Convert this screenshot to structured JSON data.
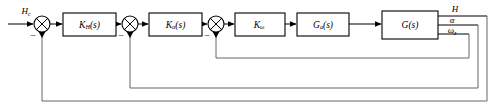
{
  "diagram": {
    "type": "control-system-block-diagram",
    "colors": {
      "line": "#000000",
      "feedback_line": "#555555",
      "background": "#ffffff",
      "block_fill": "#ffffff"
    },
    "input": {
      "label": "H",
      "subscript": "c",
      "name": "commanded-altitude-input"
    },
    "blocks": [
      {
        "id": "k-h",
        "label": "K",
        "subscript": "H",
        "suffix": "(s)",
        "x": 63,
        "y": 13,
        "w": 53,
        "h": 23
      },
      {
        "id": "k-alpha",
        "label": "K",
        "subscript": "α",
        "suffix": "(s)",
        "x": 149,
        "y": 13,
        "w": 53,
        "h": 23
      },
      {
        "id": "k-omega",
        "label": "K",
        "subscript": "ω",
        "suffix": "",
        "x": 235,
        "y": 13,
        "w": 50,
        "h": 23
      },
      {
        "id": "g-a",
        "label": "G",
        "subscript": "a",
        "suffix": "(s)",
        "x": 297,
        "y": 13,
        "w": 52,
        "h": 23
      },
      {
        "id": "g-plant",
        "label": "G",
        "subscript": "",
        "suffix": "(s)",
        "x": 382,
        "y": 11,
        "w": 56,
        "h": 28
      }
    ],
    "summing_junctions": [
      {
        "id": "sum-1",
        "cx": 42,
        "cy": 24,
        "r": 8,
        "sign": "−"
      },
      {
        "id": "sum-2",
        "cx": 130,
        "cy": 24,
        "r": 8,
        "sign": "−"
      },
      {
        "id": "sum-3",
        "cx": 216,
        "cy": 24,
        "r": 8,
        "sign": "−"
      }
    ],
    "outputs": [
      {
        "id": "out-h",
        "label": "H",
        "subscript": "",
        "x": 455,
        "y": 11
      },
      {
        "id": "out-alpha",
        "label": "α",
        "subscript": "",
        "x": 455,
        "y": 24
      },
      {
        "id": "out-omega",
        "label": "ω",
        "subscript": "z",
        "x": 455,
        "y": 37
      }
    ],
    "feedback_paths": [
      {
        "id": "fb-omega",
        "source": "out-omega",
        "target": "sum-3",
        "signal": "ω",
        "signal_subscript": "z",
        "level_y": 58
      },
      {
        "id": "fb-alpha",
        "source": "out-alpha",
        "target": "sum-2",
        "signal": "α",
        "signal_subscript": "",
        "level_y": 88
      },
      {
        "id": "fb-altitude",
        "source": "out-h",
        "target": "sum-1",
        "signal": "H",
        "signal_subscript": "",
        "level_y": 101
      }
    ]
  }
}
